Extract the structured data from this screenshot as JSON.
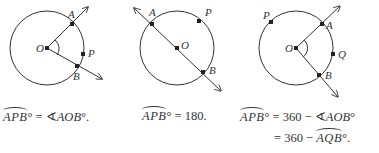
{
  "figure": {
    "stroke_color": "#333333",
    "panels": [
      {
        "id": "minor-arc",
        "labels": {
          "center": "O",
          "a": "A",
          "b": "B",
          "p": "P"
        },
        "equation": {
          "arc": "APB",
          "degree": "°",
          "equals": " = ",
          "angle_symbol": "∢",
          "angle": "AOB",
          "suffix": "°."
        }
      },
      {
        "id": "semicircle",
        "labels": {
          "center": "O",
          "a": "A",
          "b": "B",
          "p": "P"
        },
        "equation": {
          "arc": "APB",
          "degree": "°",
          "equals": " = ",
          "value": "180."
        }
      },
      {
        "id": "major-arc",
        "labels": {
          "center": "O",
          "a": "A",
          "b": "B",
          "p": "P",
          "q": "Q"
        },
        "equation": {
          "arc": "APB",
          "degree": "°",
          "equals": " = ",
          "line1_rest": "360 − ",
          "angle_symbol": "∢",
          "angle": "AOB",
          "angle_suffix": "°",
          "line2_prefix": "= 360 − ",
          "arc2": "AQB",
          "arc2_suffix": "°."
        }
      }
    ]
  }
}
